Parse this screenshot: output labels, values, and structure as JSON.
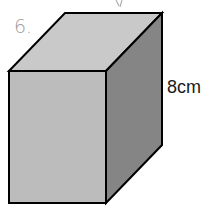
{
  "figure": {
    "shape": "rectangular prism (cuboid)",
    "dimension_label": "8cm",
    "handwritten_note": "6.",
    "colors": {
      "top_face": "#c9c9c9",
      "front_face": "#bcbcbc",
      "side_face": "#858585",
      "edge": "#000000",
      "handwriting": "#a0a0a0"
    }
  }
}
